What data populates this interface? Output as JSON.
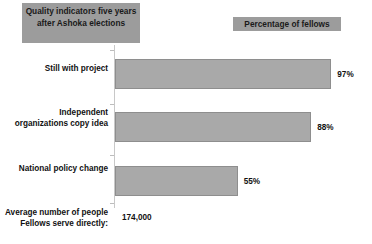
{
  "header": {
    "title": "Quality indicators five years after Ashoka elections",
    "legend": "Percentage of fellows"
  },
  "footer": {
    "label": "Average number of people Fellows serve directly:",
    "value": "174,000"
  },
  "chart_data": {
    "type": "bar",
    "orientation": "horizontal",
    "title": "Quality indicators five years after Ashoka elections",
    "xlabel": "",
    "ylabel": "",
    "xlim": [
      0,
      100
    ],
    "grid": false,
    "legend": "Percentage of fellows",
    "legend_position": "top-right",
    "categories": [
      "Still with project",
      "Independent organizations copy idea",
      "National policy change"
    ],
    "values": [
      97,
      88,
      55
    ],
    "value_labels": [
      "97%",
      "88%",
      "55%"
    ],
    "annotations": [
      {
        "label": "Average number of people Fellows serve directly:",
        "value": "174,000"
      }
    ],
    "colors": {
      "bar_fill": "#a9a9a9",
      "bar_border": "#8e8e8e",
      "header_box": "#9c9c9c",
      "axis": "#c8c8c8",
      "text": "#111111",
      "background": "#ffffff"
    }
  }
}
